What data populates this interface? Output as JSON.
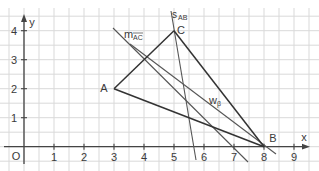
{
  "diagram": {
    "type": "coordinate-geometry",
    "colors": {
      "grid": "#d9d9d9",
      "axis": "#444444",
      "triangle": "#333333",
      "construction": "#555555",
      "text": "#3a3a3a",
      "background": "#ffffff"
    },
    "axes": {
      "x_label": "x",
      "y_label": "y",
      "origin_label": "O",
      "x_ticks": [
        "1",
        "2",
        "3",
        "4",
        "5",
        "6",
        "7",
        "8",
        "9"
      ],
      "y_ticks": [
        "1",
        "2",
        "3",
        "4"
      ],
      "x_range": [
        0,
        9.5
      ],
      "y_range": [
        -0.5,
        4.6
      ]
    },
    "points": [
      {
        "name": "A",
        "x": 3,
        "y": 2
      },
      {
        "name": "B",
        "x": 8,
        "y": 0
      },
      {
        "name": "C",
        "x": 5,
        "y": 4
      }
    ],
    "triangle": [
      "A",
      "B",
      "C"
    ],
    "lines": [
      {
        "id": "s_AB",
        "label": "s",
        "subscript": "AB",
        "kind": "perpendicular bisector of AB"
      },
      {
        "id": "m_AC",
        "label": "m",
        "subscript": "AC",
        "overline": true,
        "kind": "perpendicular bisector of AC"
      },
      {
        "id": "w_beta",
        "label": "w",
        "subscript": "β",
        "kind": "angle bisector at B"
      }
    ]
  }
}
